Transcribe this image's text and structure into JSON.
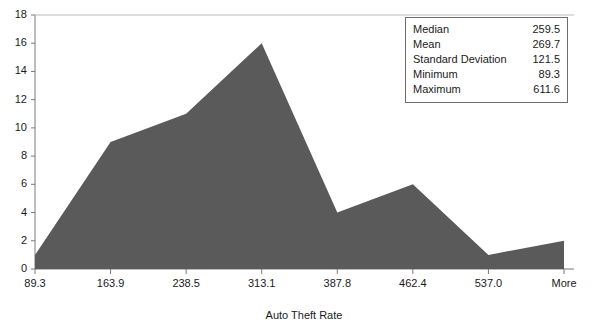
{
  "chart_data": {
    "type": "area",
    "title": "",
    "clipped_top_label": "",
    "xlabel": "Auto Theft Rate",
    "ylabel": "",
    "categories": [
      "89.3",
      "163.9",
      "238.5",
      "313.1",
      "387.8",
      "462.4",
      "537.0",
      "More"
    ],
    "values": [
      1,
      9,
      11,
      16,
      4,
      6,
      1,
      2
    ],
    "ylim": [
      0,
      18
    ],
    "yticks": [
      18,
      16,
      14,
      12,
      10,
      8,
      6,
      4,
      2,
      0
    ],
    "grid": false,
    "legend": "none",
    "series_color": "#5a5a5a",
    "axis_color": "#7a7a7a"
  },
  "stats_box": {
    "rows": [
      {
        "label": "Median",
        "value": "259.5"
      },
      {
        "label": "Mean",
        "value": "269.7"
      },
      {
        "label": "Standard Deviation",
        "value": "121.5"
      },
      {
        "label": "Minimum",
        "value": "89.3"
      },
      {
        "label": "Maximum",
        "value": "611.6"
      }
    ]
  }
}
